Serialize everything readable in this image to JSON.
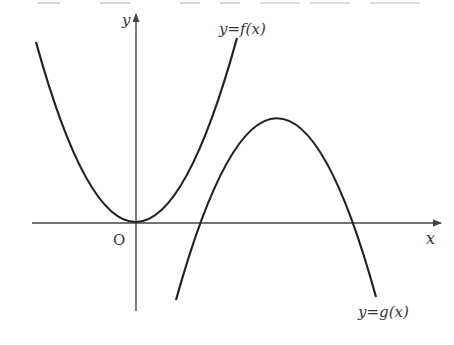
{
  "header": {
    "clipped_text": "(clipped line of question text above the figure)"
  },
  "figure": {
    "axes": {
      "x_label": "x",
      "y_label": "y",
      "origin_label": "O"
    },
    "curves": [
      {
        "name": "f",
        "label": "y=f(x)",
        "shape": "upward parabola with vertex at origin"
      },
      {
        "name": "g",
        "label": "y=g(x)",
        "shape": "downward parabola with vertex in first quadrant, crossing x-axis at two positive x values"
      }
    ],
    "colors": {
      "stroke": "#222222",
      "axis": "#444444",
      "text": "#333333"
    }
  }
}
